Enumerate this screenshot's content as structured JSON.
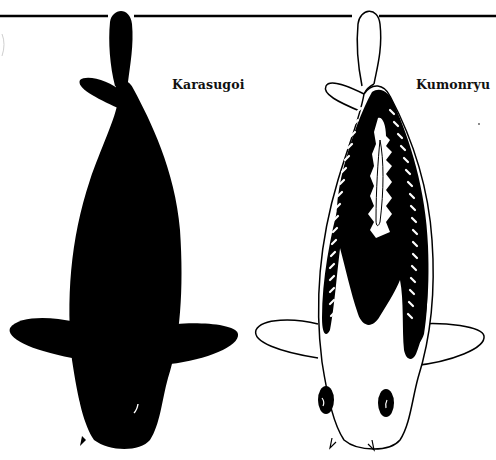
{
  "illustration": {
    "labels": {
      "left_fish": "Karasugoi",
      "right_fish": "Kumonryu"
    },
    "colors": {
      "background": "#ffffff",
      "ink": "#000000",
      "left_fish_body": "#000000",
      "right_fish_base": "#ffffff",
      "right_fish_pattern": "#000000"
    }
  }
}
